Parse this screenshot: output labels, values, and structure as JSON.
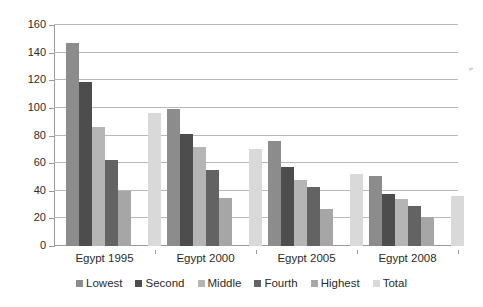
{
  "chart_data": {
    "type": "bar",
    "title": "",
    "subtitle": "",
    "xlabel": "",
    "ylabel": "",
    "categories": [
      "Egypt 1995",
      "Egypt 2000",
      "Egypt 2005",
      "Egypt 2008"
    ],
    "series": [
      {
        "name": "Lowest",
        "color": "#8c8c8c",
        "values": [
          147,
          99,
          76,
          51
        ]
      },
      {
        "name": "Second",
        "color": "#4d4d4d",
        "values": [
          119,
          81,
          57,
          38
        ]
      },
      {
        "name": "Middle",
        "color": "#b5b5b5",
        "values": [
          86,
          72,
          48,
          34
        ]
      },
      {
        "name": "Fourth",
        "color": "#636363",
        "values": [
          62,
          55,
          43,
          29
        ]
      },
      {
        "name": "Highest",
        "color": "#a6a6a6",
        "values": [
          40,
          35,
          27,
          21
        ]
      },
      {
        "name": "Total",
        "color": "#d9d9d9",
        "values": [
          96,
          70,
          52,
          36
        ]
      }
    ],
    "ylim": [
      0,
      160
    ],
    "yticks": [
      0,
      20,
      40,
      60,
      80,
      100,
      120,
      140,
      160
    ],
    "ytick_labels": [
      "0",
      "20",
      "40",
      "60",
      "80",
      "100",
      "120",
      "140",
      "160"
    ],
    "grid": true,
    "grid_axis": "y",
    "legend_position": "bottom",
    "legend_entries": [
      "Lowest",
      "Second",
      "Middle",
      "Fourth",
      "Highest",
      "Total"
    ],
    "annotations": [],
    "background_color": "#ffffff",
    "grid_color": "#b8b8b8",
    "axis_color": "#9a9a9a",
    "text_color": "#2b2b2b"
  }
}
